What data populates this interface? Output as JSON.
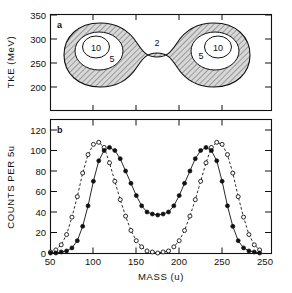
{
  "figure": {
    "panels": [
      {
        "id": "a",
        "label": "a",
        "ylabel": "TKE (MeV)",
        "yticks": [
          350,
          300,
          250,
          200
        ],
        "ylim": [
          185,
          350
        ],
        "contour_labels": [
          {
            "text": "10",
            "x": 92,
            "y": 288
          },
          {
            "text": "5",
            "x": 108,
            "y": 272
          },
          {
            "text": "2",
            "x": 150,
            "y": 292
          },
          {
            "text": "5",
            "x": 190,
            "y": 272
          },
          {
            "text": "10",
            "x": 206,
            "y": 288
          }
        ]
      },
      {
        "id": "b",
        "label": "b",
        "ylabel": "COUNTS PER 5u",
        "yticks": [
          120,
          100,
          80,
          60,
          40,
          20,
          0
        ],
        "ylim": [
          0,
          130
        ]
      }
    ],
    "xlabel": "MASS (u)",
    "xticks": [
      50,
      100,
      150,
      200,
      250
    ],
    "xlim": [
      40,
      255
    ]
  },
  "chart_data": [
    {
      "type": "heatmap",
      "title": "",
      "xlabel": "MASS (u)",
      "ylabel": "TKE (MeV)",
      "xlim": [
        40,
        255
      ],
      "ylim": [
        185,
        350
      ],
      "grid": false,
      "legend": null,
      "description": "Two-dimensional contour (dumbbell / peanut shaped) of total kinetic energy versus fragment mass, with contour levels labelled 2, 5 and 10. Two symmetric lobes centred near mass 95 and mass 200 at TKE about 285 MeV, joined by a narrow waist near mass 150.",
      "contour_levels": [
        2,
        5,
        10
      ],
      "lobe_centers": [
        {
          "mass": 96,
          "tke": 285
        },
        {
          "mass": 202,
          "tke": 285
        }
      ],
      "waist": {
        "mass": 150,
        "tke": 283
      }
    },
    {
      "type": "line",
      "title": "",
      "xlabel": "MASS (u)",
      "ylabel": "COUNTS PER 5u",
      "xlim": [
        40,
        255
      ],
      "ylim": [
        0,
        130
      ],
      "grid": false,
      "legend": null,
      "x": [
        50,
        55,
        60,
        65,
        70,
        75,
        80,
        85,
        90,
        95,
        100,
        105,
        110,
        115,
        120,
        125,
        130,
        135,
        140,
        145,
        150,
        155,
        160,
        165,
        170,
        175,
        180,
        185,
        190,
        195,
        200,
        205,
        210,
        215,
        220,
        225,
        230,
        235,
        240,
        245
      ],
      "series": [
        {
          "name": "open circles (dashed)",
          "marker": "open-circle",
          "linestyle": "dashed",
          "values": [
            1,
            3,
            8,
            18,
            35,
            55,
            78,
            96,
            106,
            108,
            103,
            88,
            70,
            52,
            36,
            22,
            12,
            6,
            2,
            1,
            0,
            1,
            2,
            6,
            12,
            22,
            36,
            52,
            70,
            88,
            103,
            108,
            106,
            96,
            78,
            55,
            35,
            18,
            8,
            3
          ]
        },
        {
          "name": "filled circles (solid)",
          "marker": "filled-circle",
          "linestyle": "solid",
          "values": [
            0,
            0,
            1,
            2,
            5,
            12,
            26,
            46,
            70,
            90,
            100,
            103,
            100,
            92,
            80,
            68,
            56,
            46,
            40,
            38,
            37,
            38,
            40,
            46,
            56,
            68,
            80,
            92,
            100,
            103,
            100,
            90,
            70,
            46,
            26,
            12,
            5,
            2,
            1,
            0
          ]
        }
      ]
    }
  ]
}
